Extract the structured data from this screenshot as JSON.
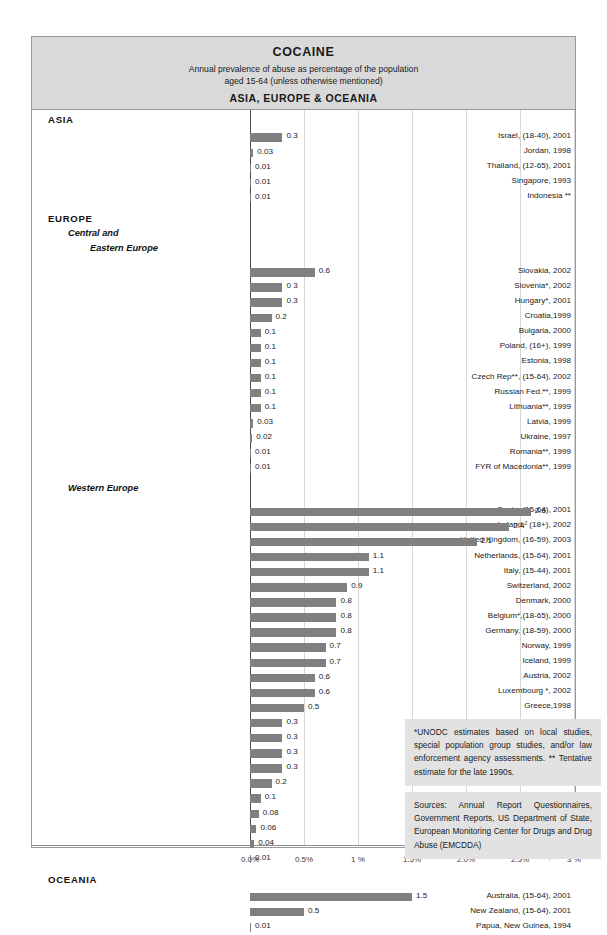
{
  "header": {
    "title": "COCAINE",
    "subtitle_line1": "Annual prevalence of abuse as percentage of the population",
    "subtitle_line2": "aged 15-64 (unless otherwise mentioned)",
    "region_line": "ASIA, EUROPE & OCEANIA"
  },
  "notes": {
    "estimates": "*UNODC estimates based on local studies, special population group studies, and/or law enforcement agency assessments. ** Tentative estimate for the late 1990s.",
    "sources": "Sources: Annual Report Questionnaires, Government Reports, US Department of State, European Monitoring Center for Drugs and Drug Abuse (EMCDDA)"
  },
  "chart_data": {
    "type": "bar",
    "orientation": "horizontal",
    "title": "COCAINE",
    "subtitle": "Annual prevalence of abuse as percentage of the population aged 15-64 (unless otherwise mentioned)",
    "xlabel": "",
    "ylabel": "",
    "xlim": [
      0,
      3
    ],
    "grid": true,
    "bar_color": "#808080",
    "tick_labels": [
      "0.0%",
      "0.5%",
      "1 %",
      "1.5%",
      "2.0%",
      "2.5%",
      "3 %"
    ],
    "tick_values": [
      0,
      0.5,
      1,
      1.5,
      2,
      2.5,
      3
    ],
    "sections": [
      {
        "name": "ASIA",
        "kind": "major",
        "subsections": [
          {
            "name": "",
            "items": [
              {
                "label": "Israel, (18-40), 2001",
                "value": 0.3,
                "value_label": "0.3"
              },
              {
                "label": "Jordan, 1998",
                "value": 0.03,
                "value_label": "0.03"
              },
              {
                "label": "Thailand, (12-65), 2001",
                "value": 0.01,
                "value_label": "0.01"
              },
              {
                "label": "Singapore, 1993",
                "value": 0.01,
                "value_label": "0.01"
              },
              {
                "label": "Indonesia **",
                "value": 0.01,
                "value_label": "0.01"
              }
            ]
          }
        ]
      },
      {
        "name": "EUROPE",
        "kind": "major",
        "subsections": [
          {
            "name": "Central and Eastern Europe",
            "name_line1": "Central and",
            "name_line2": "Eastern Europe",
            "items": [
              {
                "label": "Slovakia, 2002",
                "value": 0.6,
                "value_label": "0.6"
              },
              {
                "label": "Slovenia*, 2002",
                "value": 0.3,
                "value_label": "0 3"
              },
              {
                "label": "Hungary*, 2001",
                "value": 0.3,
                "value_label": "0.3"
              },
              {
                "label": "Croatia,1999",
                "value": 0.2,
                "value_label": "0.2"
              },
              {
                "label": "Bulgaria, 2000",
                "value": 0.1,
                "value_label": "0.1"
              },
              {
                "label": "Poland, (16+), 1999",
                "value": 0.1,
                "value_label": "0.1"
              },
              {
                "label": "Estonia, 1998",
                "value": 0.1,
                "value_label": "0.1"
              },
              {
                "label": "Czech Rep**, (15-64), 2002",
                "value": 0.1,
                "value_label": "0.1"
              },
              {
                "label": "Russian Fed.**, 1999",
                "value": 0.1,
                "value_label": "0.1"
              },
              {
                "label": "Lithuania**, 1999",
                "value": 0.1,
                "value_label": "0.1"
              },
              {
                "label": "Latvia, 1999",
                "value": 0.03,
                "value_label": "0.03"
              },
              {
                "label": "Ukraine, 1997",
                "value": 0.02,
                "value_label": "0.02"
              },
              {
                "label": "Romania**, 1999",
                "value": 0.01,
                "value_label": "0.01"
              },
              {
                "label": "FYR of Macedonia**, 1999",
                "value": 0.01,
                "value_label": "0.01"
              }
            ]
          },
          {
            "name": "Western Europe",
            "items": [
              {
                "label": "Spain, (15-64), 2001",
                "value": 2.6,
                "value_label": "2.6"
              },
              {
                "label": "Ireland,&sup2; (18+), 2002",
                "value": 2.4,
                "value_label": "2.4"
              },
              {
                "label": "United Kingdom, (16-59), 2003",
                "value": 2.1,
                "value_label": "2.1"
              },
              {
                "label": "Netherlands, (15-64), 2001",
                "value": 1.1,
                "value_label": "1.1"
              },
              {
                "label": "Italy, (15-44), 2001",
                "value": 1.1,
                "value_label": "1.1"
              },
              {
                "label": "Switzerland, 2002",
                "value": 0.9,
                "value_label": "0.9"
              },
              {
                "label": "Denmark, 2000",
                "value": 0.8,
                "value_label": "0.8"
              },
              {
                "label": "Belgium*,(18-65), 2000",
                "value": 0.8,
                "value_label": "0.8"
              },
              {
                "label": "Germany, (18-59), 2000",
                "value": 0.8,
                "value_label": "0.8"
              },
              {
                "label": "Norway, 1999",
                "value": 0.7,
                "value_label": "0.7"
              },
              {
                "label": "Iceland, 1999",
                "value": 0.7,
                "value_label": "0.7"
              },
              {
                "label": "Austria, 2002",
                "value": 0.6,
                "value_label": "0.6"
              },
              {
                "label": "Luxembourg *, 2002",
                "value": 0.6,
                "value_label": "0.6"
              },
              {
                "label": "Greece,1998",
                "value": 0.5,
                "value_label": "0.5"
              },
              {
                "label": "Portugal, 2001",
                "value": 0.3,
                "value_label": "0.3"
              },
              {
                "label": "Malta, 2001",
                "value": 0.3,
                "value_label": "0.3"
              },
              {
                "label": "France, (15-64), 2002",
                "value": 0.3,
                "value_label": "0.3"
              },
              {
                "label": "Turkey&sup1;* 2003",
                "value": 0.3,
                "value_label": "0.3"
              },
              {
                "label": "Finland, 2000",
                "value": 0.2,
                "value_label": "0.2"
              },
              {
                "label": "Liechtenstein,2000",
                "value": 0.1,
                "value_label": "0.1"
              },
              {
                "label": "Cyprus, 1999",
                "value": 0.08,
                "value_label": "0.08"
              },
              {
                "label": "Sweden, (15-69), 2000",
                "value": 0.06,
                "value_label": "0.06"
              },
              {
                "label": "San Marino,1994",
                "value": 0.04,
                "value_label": "0.04"
              },
              {
                "label": "Monaco, 1994",
                "value": 0.01,
                "value_label": "0.01"
              }
            ]
          }
        ]
      },
      {
        "name": "OCEANIA",
        "kind": "major",
        "subsections": [
          {
            "name": "",
            "items": [
              {
                "label": "Australia, (15-64), 2001",
                "value": 1.5,
                "value_label": "1.5"
              },
              {
                "label": "New Zealand, (15-64), 2001",
                "value": 0.5,
                "value_label": "0.5"
              },
              {
                "label": "Papua, New  Guinea, 1994",
                "value": 0.01,
                "value_label": "0.01"
              }
            ]
          }
        ]
      }
    ]
  }
}
